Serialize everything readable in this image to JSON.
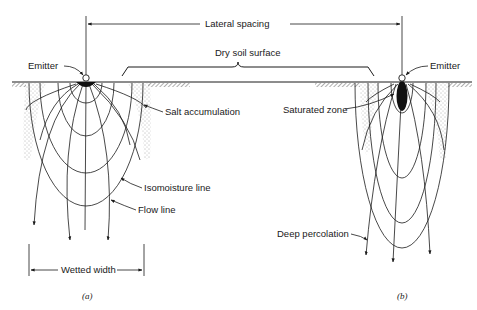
{
  "figure": {
    "type": "drip irrigation wetting pattern diagram",
    "colors": {
      "line": "#1a1a1a",
      "background": "#ffffff",
      "stipple": "#555555"
    }
  },
  "labels": {
    "lateral_spacing": "Lateral spacing",
    "dry_soil_surface": "Dry soil surface",
    "emitter_a": "Emitter",
    "emitter_b": "Emitter",
    "salt_accumulation": "Salt accumulation",
    "saturated_zone": "Saturated zone",
    "isomoisture_line": "Isomoisture line",
    "flow_line": "Flow line",
    "deep_percolation": "Deep percolation",
    "wetted_width": "Wetted width"
  },
  "panels": [
    {
      "id": "a",
      "caption": "(a)",
      "description": "Emitter on surface with wide wetting bulb"
    },
    {
      "id": "b",
      "caption": "(b)",
      "description": "Emitter with saturated zone and narrow deep wetting bulb"
    }
  ]
}
